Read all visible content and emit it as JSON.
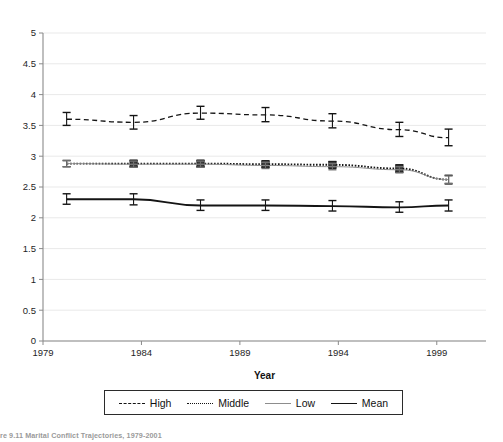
{
  "figure": {
    "caption": "re 9.11  Marital Conflict Trajectories, 1979-2001"
  },
  "chart_data": {
    "type": "line",
    "title": "",
    "xlabel": "Year",
    "ylabel": "",
    "xlim": [
      1979,
      2001.5
    ],
    "ylim": [
      0,
      5
    ],
    "ytick_labels": [
      "0",
      "0.5",
      "1",
      "1.5",
      "2",
      "2.5",
      "3",
      "3.5",
      "4",
      "4.5",
      "5"
    ],
    "ytick_values": [
      0,
      0.5,
      1,
      1.5,
      2,
      2.5,
      3,
      3.5,
      4,
      4.5,
      5
    ],
    "xtick_labels": [
      "1979",
      "1984",
      "1989",
      "1994",
      "1999"
    ],
    "xtick_values": [
      1979,
      1984,
      1989,
      1994,
      1999
    ],
    "grid": "horizontal",
    "legend_position": "below-axis",
    "error_bars": true,
    "x": [
      1980.2,
      1983.6,
      1987.0,
      1990.3,
      1993.7,
      1997.1,
      1999.6
    ],
    "series": [
      {
        "name": "High",
        "style": "dashed",
        "color": "#141414",
        "marker": "none",
        "values": [
          3.6,
          3.55,
          3.7,
          3.67,
          3.57,
          3.43,
          3.3
        ],
        "err_low": [
          3.5,
          3.44,
          3.6,
          3.56,
          3.46,
          3.32,
          3.17
        ],
        "err_high": [
          3.71,
          3.66,
          3.81,
          3.79,
          3.69,
          3.55,
          3.44
        ]
      },
      {
        "name": "Middle",
        "style": "dotted",
        "color": "#141414",
        "marker": "square",
        "values": [
          2.88,
          2.88,
          2.88,
          2.87,
          2.86,
          2.8,
          2.62
        ],
        "err_low": [
          2.83,
          2.83,
          2.83,
          2.82,
          2.81,
          2.74,
          2.55
        ],
        "err_high": [
          2.93,
          2.93,
          2.93,
          2.92,
          2.91,
          2.86,
          2.69
        ]
      },
      {
        "name": "Low",
        "style": "solid-thin",
        "color": "#8d8d8d",
        "marker": "none",
        "values": [
          2.88,
          2.87,
          2.87,
          2.85,
          2.83,
          2.78,
          2.62
        ],
        "err_low": [
          2.83,
          2.82,
          2.82,
          2.8,
          2.78,
          2.73,
          2.56
        ],
        "err_high": [
          2.93,
          2.92,
          2.92,
          2.9,
          2.88,
          2.83,
          2.68
        ]
      },
      {
        "name": "Mean",
        "style": "solid-thick",
        "color": "#141414",
        "marker": "none",
        "values": [
          2.3,
          2.3,
          2.2,
          2.2,
          2.19,
          2.17,
          2.2
        ],
        "err_low": [
          2.22,
          2.21,
          2.12,
          2.12,
          2.11,
          2.09,
          2.11
        ],
        "err_high": [
          2.39,
          2.39,
          2.29,
          2.29,
          2.28,
          2.26,
          2.29
        ]
      }
    ]
  },
  "legend": {
    "items": [
      {
        "label": "High"
      },
      {
        "label": "Middle"
      },
      {
        "label": "Low"
      },
      {
        "label": "Mean"
      }
    ]
  }
}
